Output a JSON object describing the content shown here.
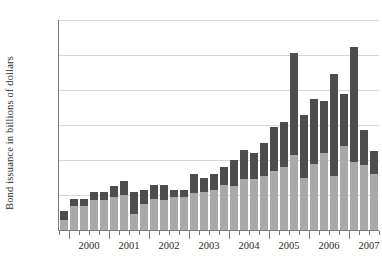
{
  "chart_data": {
    "type": "bar",
    "title": "",
    "subtitle": "",
    "xlabel": "",
    "ylabel": "Bond issuance in billions of dollars",
    "ylim": [
      0,
      240
    ],
    "yticks": [
      0,
      40,
      80,
      120,
      160,
      200,
      240
    ],
    "grid": true,
    "stacked": true,
    "legend_position": "none",
    "x_axis_major_labels": [
      "2000",
      "2001",
      "2002",
      "2003",
      "2004",
      "2005",
      "2006",
      "2007"
    ],
    "categories": [
      "1999 Q4",
      "2000 Q1",
      "2000 Q2",
      "2000 Q3",
      "2000 Q4",
      "2001 Q1",
      "2001 Q2",
      "2001 Q3",
      "2001 Q4",
      "2002 Q1",
      "2002 Q2",
      "2002 Q3",
      "2002 Q4",
      "2003 Q1",
      "2003 Q2",
      "2003 Q3",
      "2003 Q4",
      "2004 Q1",
      "2004 Q2",
      "2004 Q3",
      "2004 Q4",
      "2005 Q1",
      "2005 Q2",
      "2005 Q3",
      "2005 Q4",
      "2006 Q1",
      "2006 Q2",
      "2006 Q3",
      "2006 Q4",
      "2007 Q1",
      "2007 Q2",
      "2007 Q3"
    ],
    "series": [
      {
        "name": "lower-segment",
        "color": "#a9a9a9",
        "values": [
          12,
          28,
          28,
          34,
          34,
          38,
          40,
          18,
          30,
          35,
          34,
          38,
          38,
          42,
          44,
          46,
          52,
          50,
          58,
          58,
          62,
          68,
          72,
          86,
          60,
          76,
          88,
          62,
          96,
          78,
          74,
          64
        ]
      },
      {
        "name": "upper-segment",
        "color": "#4d4d4d",
        "values": [
          10,
          8,
          7,
          10,
          10,
          12,
          16,
          26,
          16,
          16,
          18,
          8,
          8,
          22,
          16,
          18,
          20,
          30,
          34,
          30,
          38,
          50,
          52,
          116,
          72,
          74,
          60,
          116,
          60,
          131,
          40,
          26
        ]
      }
    ],
    "totals": [
      22,
      36,
      35,
      44,
      44,
      50,
      56,
      44,
      46,
      51,
      52,
      46,
      46,
      64,
      60,
      64,
      72,
      80,
      92,
      88,
      100,
      118,
      124,
      202,
      132,
      150,
      148,
      178,
      156,
      209,
      114,
      90
    ],
    "colors": {
      "lower": "#a9a9a9",
      "upper": "#4d4d4d",
      "grid": "#d8d8d8",
      "axis": "#7a7a7a",
      "text": "#2b2b2b",
      "background": "#ffffff"
    }
  }
}
